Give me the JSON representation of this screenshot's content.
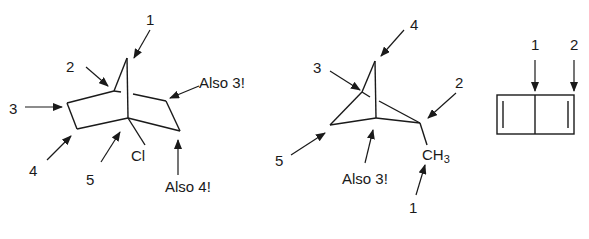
{
  "diagram": {
    "molecule_1": {
      "description": "bicyclo[2.2.1]heptane (norbornane) skeleton with Cl substituent",
      "substituent": "Cl",
      "labels": [
        "1",
        "2",
        "3",
        "4",
        "5",
        "Also 3!",
        "Also 4!"
      ]
    },
    "molecule_2": {
      "description": "bicyclo[1.1.1] cage with methyl substituent",
      "substituent_main": "CH",
      "substituent_sub": "3",
      "labels": [
        "4",
        "3",
        "2",
        "5",
        "Also 3!",
        "1"
      ]
    },
    "molecule_3": {
      "description": "bicyclo[2.2.0]hexadiene (two fused four-membered rings)",
      "labels": [
        "1",
        "2"
      ]
    }
  }
}
